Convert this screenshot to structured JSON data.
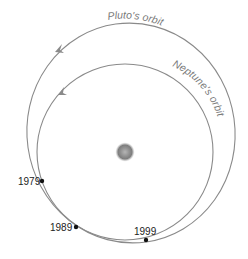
{
  "diagram": {
    "labels": {
      "pluto_orbit": "Pluto's orbit",
      "neptune_orbit": "Neptune's orbit"
    },
    "center_body": "sun",
    "positions": [
      {
        "year": "1979",
        "x": 42,
        "y": 181
      },
      {
        "year": "1989",
        "x": 76,
        "y": 227
      },
      {
        "year": "1999",
        "x": 146,
        "y": 240
      }
    ],
    "colors": {
      "orbit": "#8a8a8a",
      "dot": "#111111",
      "sun": "#8c8c8c"
    }
  }
}
